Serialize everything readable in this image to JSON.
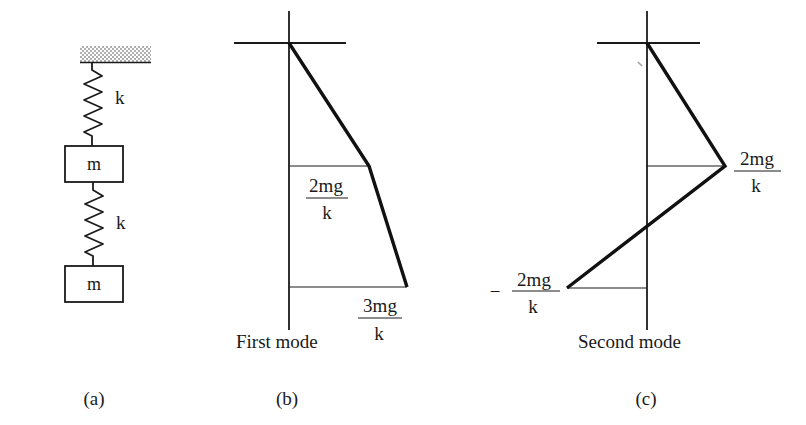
{
  "figure": {
    "panel_a": {
      "caption": "(a)",
      "spring_label_1": "k",
      "spring_label_2": "k",
      "mass_label_1": "m",
      "mass_label_2": "m"
    },
    "panel_b": {
      "caption": "(b)",
      "title": "First mode",
      "label_mass1": {
        "numerator": "2mg",
        "denominator": "k"
      },
      "label_mass2": {
        "numerator": "3mg",
        "denominator": "k"
      }
    },
    "panel_c": {
      "caption": "(c)",
      "title": "Second mode",
      "label_mass1": {
        "numerator": "2mg",
        "denominator": "k"
      },
      "label_mass2": {
        "sign": "−",
        "numerator": "2mg",
        "denominator": "k"
      }
    },
    "colors": {
      "ink": "#1a1a1a",
      "ceiling_hatch": "#9a9a9a",
      "background": "#ffffff"
    }
  }
}
